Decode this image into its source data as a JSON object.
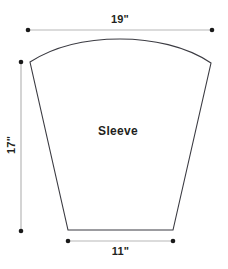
{
  "diagram": {
    "piece_label": "Sleeve",
    "stroke_color": "#3b3b42",
    "dimension_line_color": "#b7b7b7",
    "dimension_dot_color": "#1a1a1a",
    "text_color": "#231f20",
    "background_color": "#ffffff",
    "dimensions": [
      {
        "name": "top-width",
        "label": "19\"",
        "value": 19,
        "unit": "in",
        "orientation": "horizontal",
        "position": "top"
      },
      {
        "name": "side-height",
        "label": "17\"",
        "value": 17,
        "unit": "in",
        "orientation": "vertical",
        "position": "left"
      },
      {
        "name": "bottom-width",
        "label": "11\"",
        "value": 11,
        "unit": "in",
        "orientation": "horizontal",
        "position": "bottom"
      }
    ],
    "shape": {
      "type": "sleeve-pattern-polygon",
      "top_left": [
        30,
        62
      ],
      "top_right": [
        211,
        63
      ],
      "bottom_left": [
        68,
        230
      ],
      "bottom_right": [
        173,
        230
      ],
      "cap_peak": [
        120,
        39
      ],
      "cap_is_curved": true
    }
  }
}
